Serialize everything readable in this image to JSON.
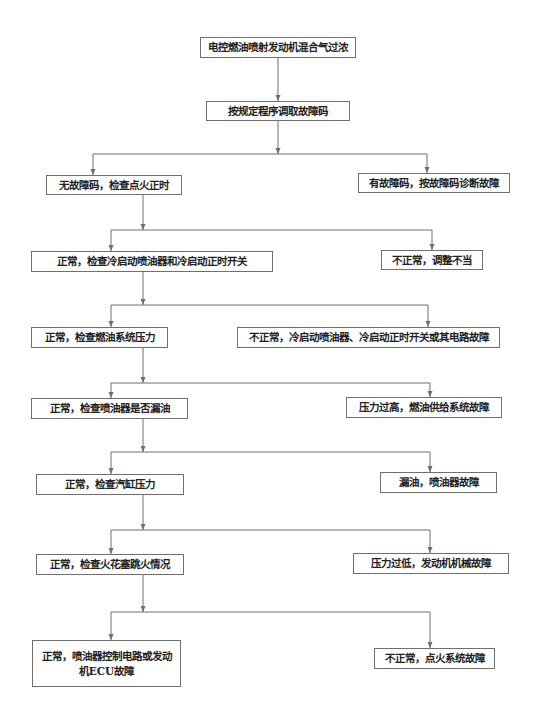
{
  "title": "电控燃油喷射发动机混合气过浓",
  "colors": {
    "line": "#6f6f6f",
    "text": "#222222",
    "box_border": "#6f6f6f",
    "background": "#ffffff"
  },
  "nodes": [
    {
      "id": "start",
      "label": "电控燃油喷射发动机混合气过浓",
      "x": 200,
      "y": 37,
      "w": 156,
      "h": 21
    },
    {
      "id": "read_codes",
      "label": "按规定程序调取故障码",
      "x": 206,
      "y": 101,
      "w": 144,
      "h": 20
    },
    {
      "id": "no_code",
      "label": "无故障码，检查点火正时",
      "x": 46,
      "y": 175,
      "w": 136,
      "h": 20
    },
    {
      "id": "has_code",
      "label": "有故障码，按故障码诊断故障",
      "x": 358,
      "y": 173,
      "w": 152,
      "h": 20
    },
    {
      "id": "check_cold",
      "label": "正常，检查冷启动喷油器和冷启动正时开关",
      "x": 31,
      "y": 251,
      "w": 242,
      "h": 21
    },
    {
      "id": "bad_timing",
      "label": "不正常，调整不当",
      "x": 381,
      "y": 250,
      "w": 102,
      "h": 20
    },
    {
      "id": "check_fuel",
      "label": "正常，检查燃油系统压力",
      "x": 31,
      "y": 327,
      "w": 137,
      "h": 21
    },
    {
      "id": "cold_fault",
      "label": "不正常，冷启动喷油器、冷启动正时开关或其电路故障",
      "x": 237,
      "y": 327,
      "w": 263,
      "h": 21
    },
    {
      "id": "check_leak",
      "label": "正常，检查喷油器是否漏油",
      "x": 31,
      "y": 398,
      "w": 157,
      "h": 21
    },
    {
      "id": "high_press",
      "label": "压力过高，燃油供给系统故障",
      "x": 346,
      "y": 397,
      "w": 156,
      "h": 21
    },
    {
      "id": "check_cyl",
      "label": "正常，检查汽缸压力",
      "x": 36,
      "y": 474,
      "w": 148,
      "h": 21
    },
    {
      "id": "leak_fault",
      "label": "漏油，喷油器故障",
      "x": 380,
      "y": 472,
      "w": 117,
      "h": 21
    },
    {
      "id": "check_spark",
      "label": "正常，检查火花塞跳火情况",
      "x": 36,
      "y": 554,
      "w": 148,
      "h": 21
    },
    {
      "id": "low_press",
      "label": "压力过低，发动机机械故障",
      "x": 353,
      "y": 553,
      "w": 156,
      "h": 21
    },
    {
      "id": "ecu_fault",
      "label": "正常，喷油器控制电路或发动机ECU故障",
      "x": 32,
      "y": 640,
      "w": 149,
      "h": 47
    },
    {
      "id": "ign_fault",
      "label": "不正常，点火系统故障",
      "x": 374,
      "y": 648,
      "w": 121,
      "h": 21
    }
  ],
  "edges": [
    {
      "from": "start",
      "to": "read_codes",
      "stem_x": 278,
      "stem_y1": 58,
      "branch_y": 0,
      "targets": []
    },
    {
      "from": "read_codes",
      "stem_x": 278,
      "stem_y1": 121,
      "branch_y": 154,
      "targets": [
        {
          "x": 93,
          "y": 175
        },
        {
          "x": 427,
          "y": 173
        }
      ]
    },
    {
      "from": "no_code",
      "stem_x": 143,
      "stem_y1": 195,
      "branch_y": 230,
      "targets": [
        {
          "x": 111,
          "y": 251
        },
        {
          "x": 432,
          "y": 250
        }
      ]
    },
    {
      "from": "check_cold",
      "stem_x": 143,
      "stem_y1": 272,
      "branch_y": 305,
      "targets": [
        {
          "x": 111,
          "y": 327
        },
        {
          "x": 428,
          "y": 327
        }
      ]
    },
    {
      "from": "check_fuel",
      "stem_x": 143,
      "stem_y1": 348,
      "branch_y": 383,
      "targets": [
        {
          "x": 111,
          "y": 398
        },
        {
          "x": 430,
          "y": 397
        }
      ]
    },
    {
      "from": "check_leak",
      "stem_x": 143,
      "stem_y1": 419,
      "branch_y": 452,
      "targets": [
        {
          "x": 111,
          "y": 474
        },
        {
          "x": 430,
          "y": 472
        }
      ]
    },
    {
      "from": "check_cyl",
      "stem_x": 143,
      "stem_y1": 495,
      "branch_y": 530,
      "targets": [
        {
          "x": 111,
          "y": 554
        },
        {
          "x": 430,
          "y": 553
        }
      ]
    },
    {
      "from": "check_spark",
      "stem_x": 143,
      "stem_y1": 575,
      "branch_y": 612,
      "targets": [
        {
          "x": 111,
          "y": 640
        },
        {
          "x": 430,
          "y": 648
        }
      ]
    }
  ],
  "direct_edges": [
    {
      "from": "start",
      "to": "read_codes",
      "x": 278,
      "y1": 58,
      "y2": 101
    }
  ]
}
